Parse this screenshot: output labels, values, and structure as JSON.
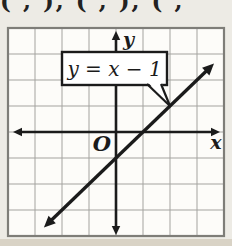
{
  "top_fragment": "( , ), ( , ), ( ,",
  "figure": {
    "equation_label": "y = x − 1",
    "x_label": "x",
    "y_label": "y",
    "origin_label": "O"
  },
  "colors": {
    "page_bg": "#edebe5",
    "grid_bg": "#fdfcf9",
    "grid_line": "#a4a39f",
    "grid_border": "#7e7d78",
    "ink": "#1b1b1b",
    "bottom_band": "#d9d3c6"
  },
  "chart_data": {
    "type": "line",
    "title": "",
    "equation": "y = x − 1",
    "slope": 1,
    "y_intercept": -1,
    "x_intercept": 1,
    "x_range_drawn": [
      -2.67,
      3.63
    ],
    "points": [
      [
        -2,
        -3
      ],
      [
        -1,
        -2
      ],
      [
        0,
        -1
      ],
      [
        1,
        0
      ],
      [
        2,
        1
      ],
      [
        3,
        2
      ]
    ],
    "xlabel": "x",
    "ylabel": "y",
    "origin_label": "O",
    "xlim": [
      -4,
      4
    ],
    "ylim": [
      -4,
      4
    ],
    "grid": true,
    "legend": false,
    "annotation": {
      "text": "y = x − 1",
      "points_to": [
        2,
        1
      ]
    }
  }
}
